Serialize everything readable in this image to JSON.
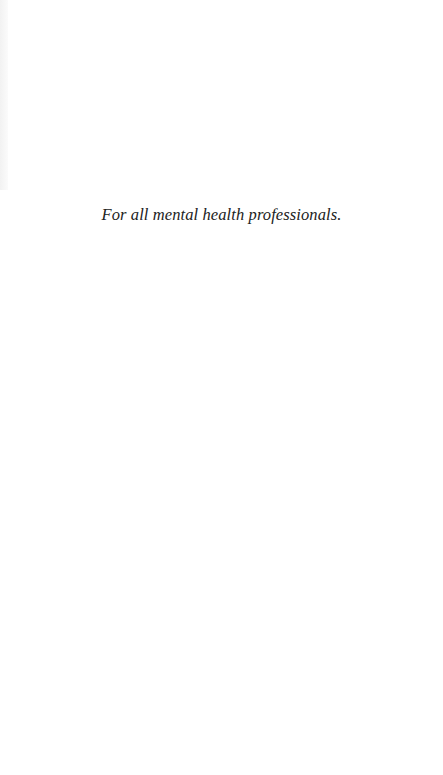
{
  "page": {
    "dedication": "For all mental health professionals."
  },
  "colors": {
    "background": "#ffffff",
    "text": "#222222"
  }
}
